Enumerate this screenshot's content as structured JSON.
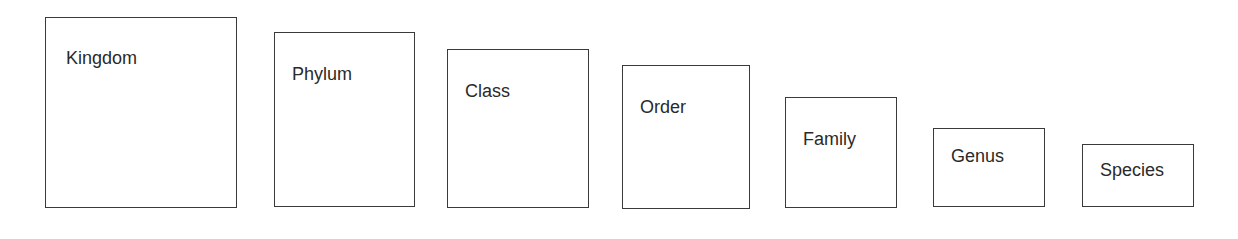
{
  "diagram": {
    "boxes": [
      {
        "label": "Kingdom",
        "x": 45,
        "y": 17,
        "w": 192,
        "h": 191,
        "lx": 20,
        "ly": 30
      },
      {
        "label": "Phylum",
        "x": 274,
        "y": 32,
        "w": 141,
        "h": 175,
        "lx": 17,
        "ly": 31
      },
      {
        "label": "Class",
        "x": 447,
        "y": 49,
        "w": 142,
        "h": 159,
        "lx": 17,
        "ly": 31
      },
      {
        "label": "Order",
        "x": 622,
        "y": 65,
        "w": 128,
        "h": 144,
        "lx": 17,
        "ly": 31
      },
      {
        "label": "Family",
        "x": 785,
        "y": 97,
        "w": 112,
        "h": 111,
        "lx": 17,
        "ly": 31
      },
      {
        "label": "Genus",
        "x": 933,
        "y": 128,
        "w": 112,
        "h": 79,
        "lx": 17,
        "ly": 17
      },
      {
        "label": "Species",
        "x": 1082,
        "y": 144,
        "w": 112,
        "h": 63,
        "lx": 17,
        "ly": 15
      }
    ]
  }
}
